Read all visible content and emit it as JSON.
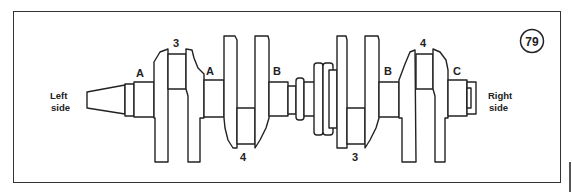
{
  "figure": {
    "number": "79"
  },
  "labels": {
    "left_side_1": "Left",
    "left_side_2": "side",
    "right_side_1": "Right",
    "right_side_2": "side",
    "journal_a_left": "A",
    "journal_a_mid": "A",
    "journal_b_left": "B",
    "journal_b_right": "B",
    "journal_c": "C",
    "crankpin_3_top": "3",
    "crankpin_4_bottom": "4",
    "crankpin_3_bottom": "3",
    "crankpin_4_top": "4"
  }
}
